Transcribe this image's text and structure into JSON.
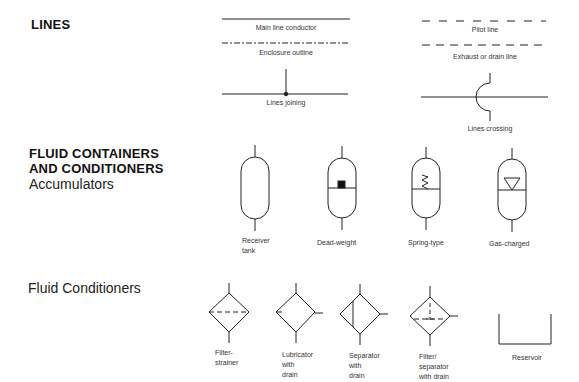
{
  "sections": {
    "lines": {
      "heading": "LINES",
      "items": {
        "main_line": "Main line conductor",
        "enclosure": "Enclosure outline",
        "joining": "Lines joining",
        "pilot": "Pilot line",
        "exhaust": "Exhaust or drain line",
        "crossing": "Lines crossing"
      }
    },
    "containers": {
      "heading_line1": "FLUID CONTAINERS",
      "heading_line2": "AND CONDITIONERS",
      "subheading": "Accumulators",
      "accumulators": {
        "receiver_1": "Receiver",
        "receiver_2": "tank",
        "deadweight": "Dead-weight",
        "spring": "Spring-type",
        "gas": "Gas-charged"
      }
    },
    "conditioners": {
      "subheading": "Fluid Conditioners",
      "items": {
        "filter_1": "Filter-",
        "filter_2": "strainer",
        "lubricator_1": "Lubricator",
        "lubricator_2": "with",
        "lubricator_3": "drain",
        "separator_1": "Separator",
        "separator_2": "with",
        "separator_3": "drain",
        "filtersep_1": "Filter/",
        "filtersep_2": "separator",
        "filtersep_3": "with drain",
        "reservoir": "Reservoir"
      }
    }
  },
  "colors": {
    "stroke": "#222222",
    "background": "#ffffff"
  }
}
